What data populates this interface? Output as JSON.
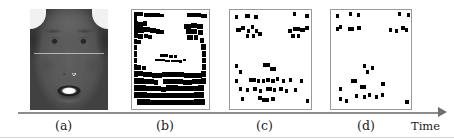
{
  "figure": {
    "name": "feature-sparsification-sequence",
    "axis": {
      "label": "Time",
      "direction": "left-to-right",
      "color": "#8d8d8d"
    },
    "captions": {
      "a": "(a)",
      "b": "(b)",
      "c": "(c)",
      "d": "(d)"
    },
    "panels": [
      {
        "id": "a",
        "caption": "(a)",
        "type": "grayscale-face-photo",
        "description": "Grayscale frontal face photograph of a smiling person",
        "has_border": false
      },
      {
        "id": "b",
        "caption": "(b)",
        "type": "binary-block-map",
        "description": "Dense binary block map of facial feature regions",
        "has_border": true,
        "fill_color": "#000000",
        "background_color": "#ffffff"
      },
      {
        "id": "c",
        "caption": "(c)",
        "type": "sparse-dot-map",
        "description": "Sparse binary dot map, reduced feature set",
        "has_border": true,
        "fill_color": "#000000",
        "background_color": "#ffffff"
      },
      {
        "id": "d",
        "caption": "(d)",
        "type": "sparse-dot-map",
        "description": "Sparsest binary dot map, fewest retained features",
        "has_border": true,
        "fill_color": "#000000",
        "background_color": "#ffffff"
      }
    ]
  },
  "chart_data": {
    "type": "scatter",
    "title": "",
    "xlabel": "Time",
    "ylabel": "",
    "grid": false,
    "legend": null,
    "note": "Four-stage sequence: photo (a) then progressively sparser binary feature maps (b), (c), (d) along the Time axis. Marker coordinates are normalized 0-100 within each panel box.",
    "panels": [
      {
        "id": "b",
        "caption": "(b)",
        "kind": "binary-block-map",
        "marker_count": 120,
        "blocks": [
          [
            2,
            2,
            7,
            4
          ],
          [
            9,
            2,
            5,
            4
          ],
          [
            2,
            6,
            5,
            5
          ],
          [
            16,
            3,
            12,
            4
          ],
          [
            28,
            3,
            8,
            4
          ],
          [
            36,
            4,
            6,
            3
          ],
          [
            72,
            3,
            10,
            4
          ],
          [
            82,
            3,
            8,
            4
          ],
          [
            90,
            4,
            8,
            4
          ],
          [
            2,
            11,
            6,
            6
          ],
          [
            8,
            12,
            6,
            5
          ],
          [
            14,
            11,
            5,
            5
          ],
          [
            2,
            17,
            7,
            6
          ],
          [
            9,
            17,
            6,
            6
          ],
          [
            16,
            17,
            8,
            5
          ],
          [
            24,
            18,
            7,
            5
          ],
          [
            31,
            19,
            5,
            5
          ],
          [
            36,
            20,
            5,
            4
          ],
          [
            68,
            14,
            8,
            5
          ],
          [
            76,
            13,
            9,
            5
          ],
          [
            85,
            14,
            7,
            5
          ],
          [
            70,
            19,
            8,
            5
          ],
          [
            78,
            19,
            7,
            5
          ],
          [
            86,
            20,
            6,
            5
          ],
          [
            2,
            23,
            6,
            5
          ],
          [
            8,
            24,
            6,
            5
          ],
          [
            15,
            24,
            6,
            4
          ],
          [
            21,
            25,
            5,
            4
          ],
          [
            72,
            25,
            7,
            5
          ],
          [
            80,
            25,
            6,
            5
          ],
          [
            2,
            29,
            5,
            5
          ],
          [
            7,
            30,
            5,
            4
          ],
          [
            88,
            28,
            6,
            5
          ],
          [
            2,
            35,
            4,
            5
          ],
          [
            90,
            34,
            6,
            6
          ],
          [
            2,
            41,
            4,
            6
          ],
          [
            91,
            41,
            5,
            6
          ],
          [
            2,
            48,
            4,
            6
          ],
          [
            91,
            48,
            5,
            6
          ],
          [
            36,
            44,
            6,
            3
          ],
          [
            42,
            44,
            5,
            3
          ],
          [
            48,
            45,
            5,
            3
          ],
          [
            54,
            45,
            5,
            3
          ],
          [
            30,
            49,
            6,
            3
          ],
          [
            36,
            49,
            7,
            3
          ],
          [
            43,
            50,
            6,
            3
          ],
          [
            50,
            50,
            6,
            3
          ],
          [
            56,
            50,
            5,
            3
          ],
          [
            61,
            51,
            4,
            3
          ],
          [
            66,
            49,
            4,
            3
          ],
          [
            2,
            55,
            5,
            6
          ],
          [
            7,
            56,
            5,
            5
          ],
          [
            13,
            57,
            5,
            4
          ],
          [
            91,
            55,
            5,
            6
          ],
          [
            2,
            62,
            6,
            6
          ],
          [
            8,
            62,
            6,
            5
          ],
          [
            14,
            63,
            6,
            5
          ],
          [
            20,
            63,
            6,
            5
          ],
          [
            26,
            64,
            6,
            5
          ],
          [
            32,
            64,
            7,
            5
          ],
          [
            39,
            63,
            7,
            5
          ],
          [
            46,
            63,
            7,
            5
          ],
          [
            53,
            63,
            7,
            5
          ],
          [
            60,
            63,
            7,
            5
          ],
          [
            67,
            64,
            6,
            5
          ],
          [
            73,
            64,
            6,
            5
          ],
          [
            79,
            64,
            6,
            5
          ],
          [
            85,
            64,
            6,
            5
          ],
          [
            90,
            62,
            6,
            6
          ],
          [
            2,
            69,
            7,
            6
          ],
          [
            9,
            69,
            7,
            6
          ],
          [
            16,
            70,
            6,
            5
          ],
          [
            22,
            70,
            6,
            5
          ],
          [
            28,
            71,
            6,
            5
          ],
          [
            40,
            70,
            7,
            5
          ],
          [
            47,
            70,
            7,
            5
          ],
          [
            54,
            70,
            6,
            5
          ],
          [
            60,
            70,
            6,
            5
          ],
          [
            66,
            71,
            6,
            5
          ],
          [
            72,
            71,
            6,
            5
          ],
          [
            78,
            70,
            6,
            5
          ],
          [
            84,
            70,
            6,
            5
          ],
          [
            90,
            69,
            6,
            6
          ],
          [
            2,
            76,
            8,
            6
          ],
          [
            10,
            76,
            8,
            6
          ],
          [
            18,
            77,
            7,
            5
          ],
          [
            25,
            77,
            7,
            5
          ],
          [
            32,
            77,
            6,
            5
          ],
          [
            38,
            78,
            6,
            5
          ],
          [
            44,
            76,
            8,
            6
          ],
          [
            52,
            76,
            8,
            6
          ],
          [
            60,
            77,
            7,
            5
          ],
          [
            67,
            77,
            7,
            5
          ],
          [
            74,
            77,
            6,
            5
          ],
          [
            80,
            77,
            6,
            5
          ],
          [
            86,
            76,
            7,
            6
          ],
          [
            3,
            83,
            8,
            6
          ],
          [
            11,
            83,
            8,
            6
          ],
          [
            19,
            84,
            7,
            5
          ],
          [
            26,
            84,
            7,
            5
          ],
          [
            33,
            84,
            7,
            5
          ],
          [
            40,
            84,
            7,
            5
          ],
          [
            47,
            84,
            7,
            5
          ],
          [
            54,
            84,
            7,
            5
          ],
          [
            61,
            84,
            7,
            5
          ],
          [
            68,
            84,
            6,
            5
          ],
          [
            74,
            84,
            6,
            5
          ],
          [
            80,
            83,
            7,
            6
          ],
          [
            86,
            83,
            7,
            6
          ],
          [
            6,
            90,
            9,
            6
          ],
          [
            15,
            90,
            9,
            6
          ],
          [
            24,
            91,
            8,
            5
          ],
          [
            32,
            91,
            8,
            5
          ],
          [
            40,
            91,
            8,
            5
          ],
          [
            48,
            91,
            8,
            5
          ],
          [
            56,
            91,
            8,
            5
          ],
          [
            64,
            91,
            8,
            5
          ],
          [
            72,
            91,
            8,
            5
          ],
          [
            80,
            90,
            8,
            6
          ],
          [
            88,
            90,
            7,
            6
          ]
        ]
      },
      {
        "id": "c",
        "caption": "(c)",
        "kind": "sparse-dot-map",
        "marker_count": 47,
        "blocks": [
          [
            6,
            5,
            4,
            4
          ],
          [
            18,
            4,
            7,
            4
          ],
          [
            30,
            5,
            4,
            4
          ],
          [
            78,
            2,
            4,
            4
          ],
          [
            93,
            4,
            4,
            4
          ],
          [
            8,
            18,
            5,
            4
          ],
          [
            14,
            16,
            5,
            4
          ],
          [
            21,
            19,
            4,
            4
          ],
          [
            26,
            15,
            4,
            4
          ],
          [
            31,
            19,
            4,
            4
          ],
          [
            20,
            24,
            4,
            4
          ],
          [
            27,
            24,
            4,
            4
          ],
          [
            35,
            22,
            4,
            4
          ],
          [
            72,
            19,
            4,
            4
          ],
          [
            78,
            17,
            8,
            4
          ],
          [
            87,
            18,
            5,
            4
          ],
          [
            93,
            16,
            5,
            4
          ],
          [
            75,
            24,
            5,
            4
          ],
          [
            83,
            24,
            4,
            4
          ],
          [
            6,
            55,
            4,
            4
          ],
          [
            11,
            61,
            4,
            4
          ],
          [
            41,
            54,
            8,
            4
          ],
          [
            49,
            58,
            8,
            4
          ],
          [
            6,
            70,
            4,
            4
          ],
          [
            24,
            69,
            8,
            4
          ],
          [
            33,
            70,
            4,
            4
          ],
          [
            39,
            70,
            4,
            4
          ],
          [
            45,
            69,
            4,
            4
          ],
          [
            51,
            70,
            4,
            4
          ],
          [
            57,
            68,
            4,
            4
          ],
          [
            64,
            70,
            4,
            4
          ],
          [
            73,
            69,
            4,
            4
          ],
          [
            86,
            70,
            4,
            4
          ],
          [
            11,
            78,
            4,
            4
          ],
          [
            20,
            79,
            4,
            4
          ],
          [
            29,
            78,
            4,
            4
          ],
          [
            36,
            80,
            4,
            4
          ],
          [
            44,
            78,
            8,
            4
          ],
          [
            53,
            79,
            4,
            4
          ],
          [
            61,
            78,
            4,
            4
          ],
          [
            68,
            80,
            4,
            4
          ],
          [
            79,
            79,
            4,
            4
          ],
          [
            13,
            88,
            4,
            4
          ],
          [
            34,
            87,
            5,
            4
          ],
          [
            40,
            89,
            8,
            4
          ],
          [
            51,
            88,
            4,
            4
          ],
          [
            94,
            90,
            4,
            4
          ]
        ]
      },
      {
        "id": "d",
        "caption": "(d)",
        "kind": "sparse-dot-map",
        "marker_count": 28,
        "blocks": [
          [
            6,
            4,
            4,
            4
          ],
          [
            22,
            2,
            4,
            4
          ],
          [
            32,
            3,
            4,
            4
          ],
          [
            84,
            2,
            4,
            4
          ],
          [
            95,
            3,
            4,
            4
          ],
          [
            6,
            17,
            4,
            4
          ],
          [
            10,
            15,
            4,
            4
          ],
          [
            21,
            17,
            8,
            4
          ],
          [
            33,
            16,
            4,
            4
          ],
          [
            72,
            18,
            4,
            4
          ],
          [
            80,
            19,
            4,
            4
          ],
          [
            88,
            16,
            4,
            4
          ],
          [
            92,
            18,
            4,
            4
          ],
          [
            40,
            55,
            4,
            4
          ],
          [
            50,
            57,
            4,
            4
          ],
          [
            44,
            61,
            4,
            4
          ],
          [
            25,
            70,
            8,
            4
          ],
          [
            10,
            78,
            4,
            4
          ],
          [
            36,
            76,
            8,
            4
          ],
          [
            63,
            73,
            4,
            4
          ],
          [
            30,
            85,
            4,
            4
          ],
          [
            40,
            86,
            4,
            4
          ],
          [
            46,
            84,
            4,
            4
          ],
          [
            55,
            86,
            4,
            4
          ],
          [
            62,
            84,
            4,
            4
          ],
          [
            10,
            88,
            4,
            4
          ],
          [
            17,
            90,
            4,
            4
          ],
          [
            93,
            91,
            4,
            4
          ]
        ]
      }
    ]
  }
}
